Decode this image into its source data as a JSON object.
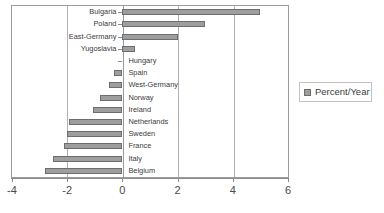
{
  "chart_data": {
    "type": "bar",
    "orientation": "horizontal",
    "title": "",
    "xlabel": "",
    "ylabel": "",
    "xlim": [
      -4,
      6
    ],
    "xticks": [
      -4,
      -2,
      0,
      2,
      4,
      6
    ],
    "xtick_labels": [
      "-4",
      "-2",
      "0",
      "2",
      "4",
      "6"
    ],
    "grid": true,
    "gridlines_at": [
      -2,
      0,
      2,
      4
    ],
    "legend_position": "right",
    "legend": [
      "Percent/Year"
    ],
    "series_name": "Percent/Year",
    "bar_color": "#9e9e9e",
    "bar_border_color": "#6d6d6d",
    "categories": [
      "Bulgaria",
      "Poland",
      "East-Germany",
      "Yugoslavia",
      "Hungary",
      "Spain",
      "West-Germany",
      "Norway",
      "Ireland",
      "Netherlands",
      "Sweden",
      "France",
      "Italy",
      "Belgium"
    ],
    "values": [
      5.0,
      3.0,
      2.0,
      0.45,
      0.0,
      -0.3,
      -0.5,
      -0.8,
      -1.05,
      -1.95,
      -2.0,
      -2.1,
      -2.5,
      -2.8
    ]
  },
  "legend": {
    "label": "Percent/Year"
  },
  "axis": {
    "labels": [
      "-4",
      "-2",
      "0",
      "2",
      "4",
      "6"
    ]
  }
}
